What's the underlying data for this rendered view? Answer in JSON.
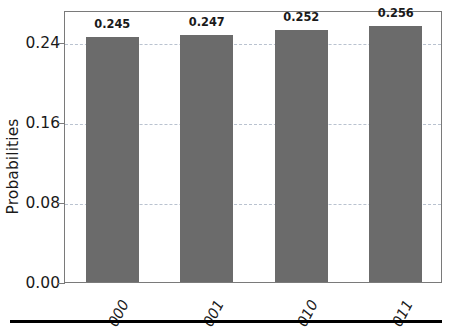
{
  "chart_data": {
    "type": "bar",
    "title": "",
    "subtitle": "",
    "xlabel": "",
    "ylabel": "Probabilities",
    "categories": [
      "000",
      "001",
      "010",
      "011"
    ],
    "values": [
      0.245,
      0.247,
      0.252,
      0.256
    ],
    "value_labels": [
      "0.245",
      "0.247",
      "0.252",
      "0.256"
    ],
    "series": [
      {
        "name": "Probabilities",
        "values": [
          0.245,
          0.247,
          0.252,
          0.256
        ]
      }
    ],
    "ylim": [
      0.0,
      0.2718
    ],
    "ytick_values": [
      0.0,
      0.08,
      0.16,
      0.24
    ],
    "ytick_labels": [
      "0.00",
      "0.08",
      "0.16",
      "0.24"
    ],
    "grid": "horizontal-dashed",
    "legend": "none",
    "bar_color": "#6b6b6b",
    "grid_color": "#b9c2cf",
    "axis_color": "#7a7a7a",
    "text_color": "#1a1a1a",
    "rule_color": "#000000",
    "xtick_rotation_deg": -62
  },
  "figure": {
    "background": "#ffffff",
    "bottom_rule_name": "horizontal-rule"
  }
}
